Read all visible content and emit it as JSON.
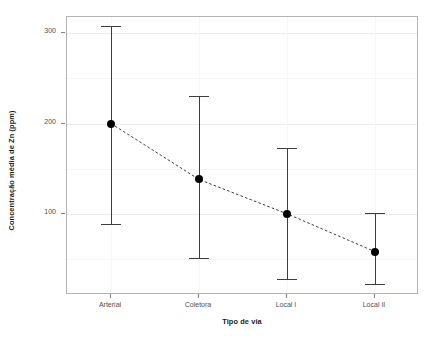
{
  "chart_data": {
    "type": "scatter",
    "title": "",
    "xlabel": "Tipo de via",
    "ylabel": "Concentração média de Zn (ppm)",
    "categories": [
      "Arterial",
      "Coletora",
      "Local I",
      "Local II"
    ],
    "values": [
      200,
      138,
      100,
      58
    ],
    "error_low": [
      89,
      51,
      28,
      22
    ],
    "error_high": [
      308,
      230,
      173,
      101
    ],
    "ylim": [
      10,
      318
    ],
    "y_ticks": [
      100,
      200,
      300
    ],
    "y_tick_labels": [
      "100",
      "200",
      "300"
    ],
    "grid": true,
    "legend": "none",
    "connector_line_style": "dashed",
    "point_color": "#000000",
    "errorbar_color": "#3d3d3d",
    "panel_border_color": "#b4b4b4",
    "gridline_color": "#ebebeb",
    "background_color": "#ffffff",
    "series": [
      {
        "name": "Concentração média de Zn (ppm)",
        "points": [
          {
            "category": "Arterial",
            "mean": 200,
            "lower": 89,
            "upper": 308
          },
          {
            "category": "Coletora",
            "mean": 138,
            "lower": 51,
            "upper": 230
          },
          {
            "category": "Local I",
            "mean": 100,
            "lower": 28,
            "upper": 173
          },
          {
            "category": "Local II",
            "mean": 58,
            "lower": 22,
            "upper": 101
          }
        ]
      }
    ]
  }
}
